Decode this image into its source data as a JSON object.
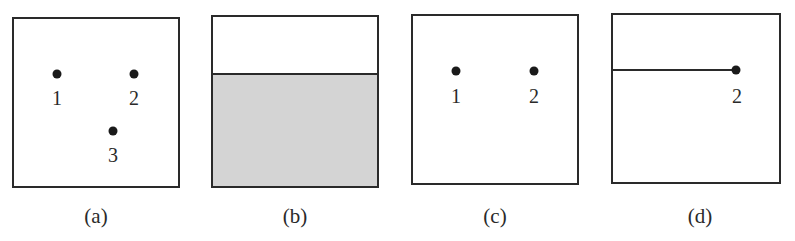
{
  "panels": [
    {
      "id": "a",
      "caption": "(a)",
      "box": {
        "x": 12,
        "y": 17,
        "w": 168,
        "h": 171
      },
      "points": [
        {
          "label": "1",
          "x": 57,
          "y": 74
        },
        {
          "label": "2",
          "x": 134,
          "y": 74
        },
        {
          "label": "3",
          "x": 113,
          "y": 131
        }
      ]
    },
    {
      "id": "b",
      "caption": "(b)",
      "box": {
        "x": 211,
        "y": 15,
        "w": 168,
        "h": 173
      },
      "fill": {
        "color": "#d4d4d4",
        "divider_y": 73
      }
    },
    {
      "id": "c",
      "caption": "(c)",
      "box": {
        "x": 411,
        "y": 14,
        "w": 168,
        "h": 171
      },
      "points": [
        {
          "label": "1",
          "x": 456,
          "y": 71
        },
        {
          "label": "2",
          "x": 534,
          "y": 71
        }
      ]
    },
    {
      "id": "d",
      "caption": "(d)",
      "box": {
        "x": 611,
        "y": 13,
        "w": 170,
        "h": 171
      },
      "line": {
        "x1": 611,
        "x2": 736,
        "y": 70
      },
      "points": [
        {
          "label": "2",
          "x": 736,
          "y": 70
        }
      ]
    }
  ]
}
